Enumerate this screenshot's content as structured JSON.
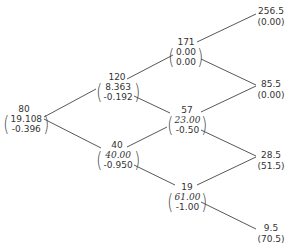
{
  "diagram": {
    "type": "binomial-tree",
    "line_color": "#333333",
    "text_color": "#333333",
    "nodes": {
      "n0": {
        "price": "80",
        "v1": "19.108",
        "v2": "-0.396",
        "v1_italic": false
      },
      "n1u": {
        "price": "120",
        "v1": "8.363",
        "v2": "-0.192",
        "v1_italic": false
      },
      "n1d": {
        "price": "40",
        "v1": "40.00",
        "v2": "-0.950",
        "v1_italic": true
      },
      "n2uu": {
        "price": "171",
        "v1": "0.00",
        "v2": "0.00",
        "v1_italic": false
      },
      "n2ud": {
        "price": "57",
        "v1": "23.00",
        "v2": "-0.50",
        "v1_italic": true
      },
      "n2dd": {
        "price": "19",
        "v1": "61.00",
        "v2": "-1.00",
        "v1_italic": true
      }
    },
    "leaves": {
      "l3uuu": {
        "price": "256.5",
        "payoff": "(0.00)"
      },
      "l3uud": {
        "price": "85.5",
        "payoff": "(0.00)"
      },
      "l3udd": {
        "price": "28.5",
        "payoff": "(51.5)"
      },
      "l3ddd": {
        "price": "9.5",
        "payoff": "(70.5)"
      }
    }
  }
}
